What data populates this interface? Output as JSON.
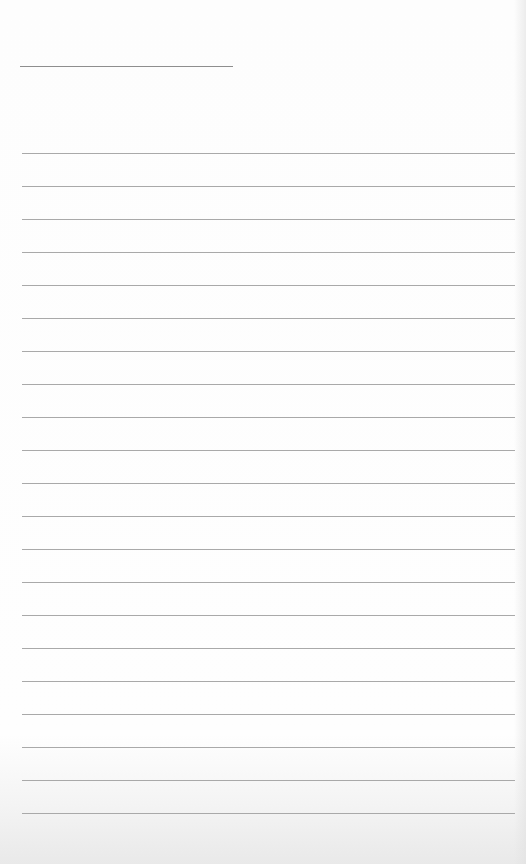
{
  "page": {
    "type": "blank-lined-sheet",
    "header": {
      "text": "",
      "line": {
        "x": 20,
        "y": 66,
        "width": 213,
        "color": "#8e8e8e"
      }
    },
    "rules": {
      "count": 21,
      "first_y": 153,
      "spacing": 33,
      "left": 22,
      "width": 493,
      "color": "#a9a9a9"
    },
    "lines_text": [
      "",
      "",
      "",
      "",
      "",
      "",
      "",
      "",
      "",
      "",
      "",
      "",
      "",
      "",
      "",
      "",
      "",
      "",
      "",
      "",
      ""
    ]
  }
}
